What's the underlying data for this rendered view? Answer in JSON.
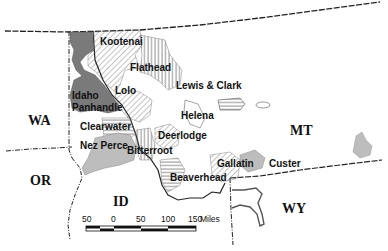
{
  "map": {
    "type": "regional map",
    "subject": "National forests of northern Idaho and western Montana"
  },
  "states": [
    {
      "abbr": "WA",
      "x": 28,
      "y": 125
    },
    {
      "abbr": "OR",
      "x": 30,
      "y": 185
    },
    {
      "abbr": "ID",
      "x": 113,
      "y": 206
    },
    {
      "abbr": "MT",
      "x": 290,
      "y": 135
    },
    {
      "abbr": "WY",
      "x": 282,
      "y": 213
    }
  ],
  "forests": [
    {
      "name": "Kootenai",
      "x": 100,
      "y": 45,
      "pattern": "diagonal-hatch"
    },
    {
      "name": "Flathead",
      "x": 130,
      "y": 71,
      "pattern": "vertical-hatch"
    },
    {
      "name": "Lewis & Clark",
      "x": 176,
      "y": 89,
      "pattern": "horizontal-hatch"
    },
    {
      "name": "Idaho",
      "x": 72,
      "y": 99,
      "pattern": "dark-gray"
    },
    {
      "name": "Panhandle",
      "x": 72,
      "y": 111,
      "pattern": "dark-gray"
    },
    {
      "name": "Lolo",
      "x": 115,
      "y": 94,
      "pattern": "diagonal-hatch"
    },
    {
      "name": "Helena",
      "x": 181,
      "y": 119,
      "pattern": "outline"
    },
    {
      "name": "Clearwater",
      "x": 80,
      "y": 130,
      "pattern": "horizontal-hatch"
    },
    {
      "name": "Deerlodge",
      "x": 158,
      "y": 139,
      "pattern": "diagonal-hatch"
    },
    {
      "name": "Nez Perce",
      "x": 80,
      "y": 149,
      "pattern": "light-gray"
    },
    {
      "name": "Bitterroot",
      "x": 127,
      "y": 154,
      "pattern": "vertical-hatch"
    },
    {
      "name": "Gallatin",
      "x": 217,
      "y": 167,
      "pattern": "diagonal-hatch"
    },
    {
      "name": "Custer",
      "x": 269,
      "y": 167,
      "pattern": "light-gray"
    },
    {
      "name": "Beaverhead",
      "x": 170,
      "y": 181,
      "pattern": "horizontal-hatch"
    }
  ],
  "scale_bar": {
    "ticks": [
      "50",
      "0",
      "50",
      "100",
      "150"
    ],
    "unit": "Miles"
  },
  "colors": {
    "dark_gray": "#7a7a7a",
    "light_gray": "#bdbdbd",
    "line": "#222222",
    "background": "#ffffff"
  }
}
